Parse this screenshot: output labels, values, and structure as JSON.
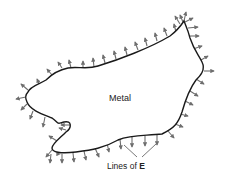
{
  "figure": {
    "body_label": "Metal",
    "lines_label_prefix": "Lines of ",
    "lines_label_symbol": "E",
    "colors": {
      "outline": "#1a1a1a",
      "arrows": "#6e6e6e",
      "text": "#222222",
      "background": "#ffffff"
    }
  }
}
